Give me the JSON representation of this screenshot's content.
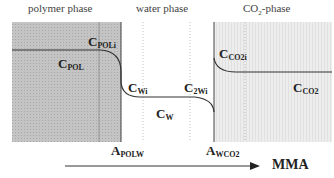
{
  "phases": {
    "polymer": "polymer phase",
    "water": "water phase",
    "co2_main": "CO",
    "co2_sub": "2",
    "co2_suffix": "-phase"
  },
  "concentrations": {
    "c_poli": {
      "main": "C",
      "sub": "POLi"
    },
    "c_pol": {
      "main": "C",
      "sub": "POL"
    },
    "c_wi": {
      "main": "C",
      "sub": "Wi"
    },
    "c_2wi": {
      "main": "C",
      "sub": "2Wi"
    },
    "c_w": {
      "main": "C",
      "sub": "W"
    },
    "c_co2i": {
      "main": "C",
      "sub": "CO2i"
    },
    "c_co2": {
      "main": "C",
      "sub": "CO2"
    }
  },
  "interfaces": {
    "a_polw": {
      "main": "A",
      "sub": "POLW"
    },
    "a_wco2": {
      "main": "A",
      "sub": "WCO2"
    }
  },
  "axis": {
    "label": "MMA"
  },
  "colors": {
    "polymer_fill": "#c4c4c4",
    "co2_fill": "#ececec",
    "curve": "#333333"
  }
}
